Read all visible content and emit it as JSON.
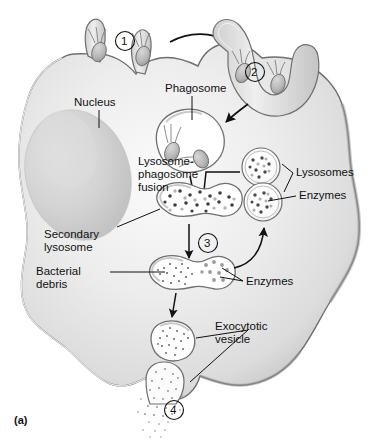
{
  "figure": {
    "panel_label": "(a)",
    "title_alt": "Phagocytosis by a phagocyte",
    "accent_color": "#111111",
    "cell_fill": "#e9e9e9",
    "membrane_color": "#6f6f6f",
    "nucleus_color": "#d2d2d2"
  },
  "steps": [
    {
      "id": "step-1",
      "number": "1"
    },
    {
      "id": "step-2",
      "number": "2"
    },
    {
      "id": "step-3",
      "number": "3"
    },
    {
      "id": "step-4",
      "number": "4"
    }
  ],
  "labels": {
    "nucleus": "Nucleus",
    "phagosome": "Phagosome",
    "fusion_line1": "Lysosome-",
    "fusion_line2": "phagosome",
    "fusion_line3": "fusion",
    "lysosomes": "Lysosomes",
    "enzymes_top": "Enzymes",
    "secondary_line1": "Secondary",
    "secondary_line2": "lysosome",
    "bacterial_line1": "Bacterial",
    "bacterial_line2": "debris",
    "enzymes_mid": "Enzymes",
    "exocytotic_line1": "Exocytotic",
    "exocytotic_line2": "vesicle"
  }
}
